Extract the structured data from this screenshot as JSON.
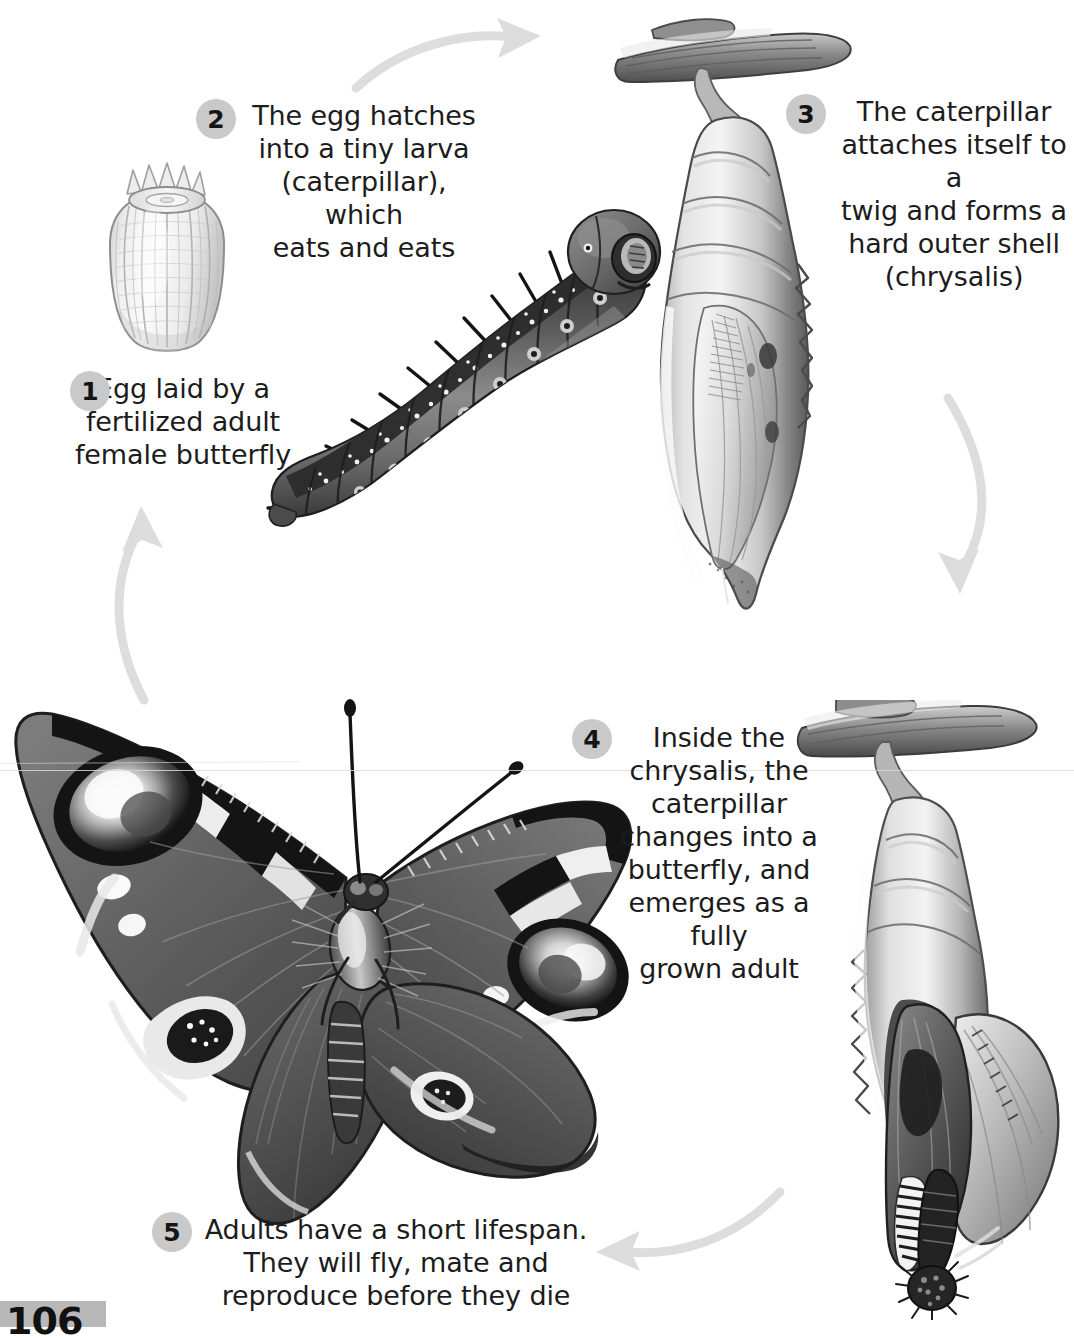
{
  "page": {
    "page_number": "106",
    "banner_color": "#b8b8b8"
  },
  "theme": {
    "background": "#ffffff",
    "text_color": "#1c1c1c",
    "badge_color": "#c9c9c9",
    "arrow_color": "#dcdcdc"
  },
  "steps": [
    {
      "number": "1",
      "text": "Egg laid by a\nfertilized adult\nfemale butterfly",
      "lines": [
        "Egg laid by a",
        "fertilized adult",
        "female butterfly"
      ],
      "illustration": "butterfly-egg"
    },
    {
      "number": "2",
      "text": "The egg hatches\ninto a tiny larva\n(caterpillar), which\neats and eats",
      "lines": [
        "The egg hatches",
        "into a tiny larva",
        "(caterpillar), which",
        "eats and eats"
      ],
      "illustration": "caterpillar-larva"
    },
    {
      "number": "3",
      "text": "The caterpillar\nattaches itself to a\ntwig and forms a\nhard outer shell\n(chrysalis)",
      "lines": [
        "The caterpillar",
        "attaches itself to a",
        "twig and forms a",
        "hard outer shell",
        "(chrysalis)"
      ],
      "illustration": "chrysalis-on-twig"
    },
    {
      "number": "4",
      "text": "Inside the\nchrysalis, the\ncaterpillar\nchanges into a\nbutterfly, and\nemerges as a fully\ngrown adult",
      "lines": [
        "Inside the",
        "chrysalis, the",
        "caterpillar",
        "changes into a",
        "butterfly, and",
        "emerges as a fully",
        "grown adult"
      ],
      "illustration": "butterfly-emerging-from-chrysalis"
    },
    {
      "number": "5",
      "text": "Adults have a short lifespan.\nThey will fly, mate and\nreproduce before they die",
      "lines": [
        "Adults have a short lifespan.",
        "They will fly, mate and",
        "reproduce before they die"
      ],
      "illustration": "adult-peacock-butterfly"
    }
  ],
  "arrows": [
    {
      "name": "arrow-egg-to-larva",
      "direction": "right"
    },
    {
      "name": "arrow-chrysalis-downward",
      "direction": "down-left"
    },
    {
      "name": "arrow-adult-to-egg",
      "direction": "up"
    },
    {
      "name": "arrow-emerging-to-adult",
      "direction": "left"
    }
  ]
}
